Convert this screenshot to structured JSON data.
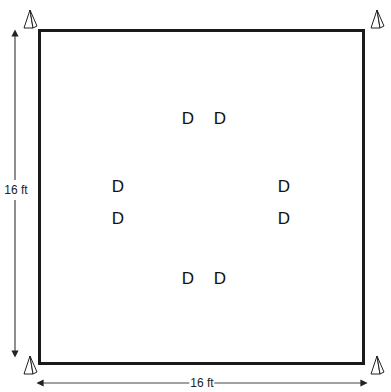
{
  "diagram": {
    "type": "floor-plan",
    "room": {
      "width_label": "16 ft",
      "height_label": "16 ft"
    },
    "corner_markers": [
      {
        "position": "top-left",
        "shape": "pyramid"
      },
      {
        "position": "top-right",
        "shape": "pyramid"
      },
      {
        "position": "bottom-left",
        "shape": "pyramid"
      },
      {
        "position": "bottom-right",
        "shape": "pyramid"
      }
    ],
    "items": [
      {
        "label": "D",
        "x": 188,
        "y": 118
      },
      {
        "label": "D",
        "x": 220,
        "y": 118
      },
      {
        "label": "D",
        "x": 118,
        "y": 186
      },
      {
        "label": "D",
        "x": 284,
        "y": 186
      },
      {
        "label": "D",
        "x": 118,
        "y": 218
      },
      {
        "label": "D",
        "x": 284,
        "y": 218
      },
      {
        "label": "D",
        "x": 188,
        "y": 278
      },
      {
        "label": "D",
        "x": 220,
        "y": 278
      }
    ],
    "colors": {
      "line": "#1a1a1a",
      "dimension": "#333333",
      "background": "#ffffff"
    }
  }
}
